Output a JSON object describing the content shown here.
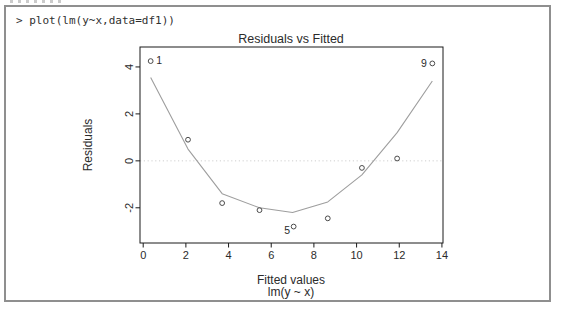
{
  "window": {
    "console": {
      "command": "> plot(lm(y~x,data=df1))"
    }
  },
  "chart_data": {
    "type": "scatter",
    "title": "Residuals vs Fitted",
    "xlabel": "Fitted values",
    "xlabel_sub": "lm(y ~ x)",
    "ylabel": "Residuals",
    "xlim": [
      -0.15,
      14.05
    ],
    "ylim": [
      -3.5,
      4.85
    ],
    "x_ticks": [
      0,
      2,
      4,
      6,
      8,
      10,
      12,
      14
    ],
    "y_ticks": [
      -2,
      0,
      2,
      4
    ],
    "grid": "off",
    "legend": "none",
    "zero_line": {
      "y": 0,
      "style": "dotted"
    },
    "points": [
      {
        "x": 0.35,
        "y": 4.25,
        "label": "1",
        "label_side": "right"
      },
      {
        "x": 2.1,
        "y": 0.9
      },
      {
        "x": 3.7,
        "y": -1.8
      },
      {
        "x": 5.45,
        "y": -2.1
      },
      {
        "x": 7.05,
        "y": -2.8,
        "label": "5",
        "label_side": "left-below"
      },
      {
        "x": 8.65,
        "y": -2.45
      },
      {
        "x": 10.25,
        "y": -0.3
      },
      {
        "x": 11.9,
        "y": 0.1
      },
      {
        "x": 13.55,
        "y": 4.15,
        "label": "9",
        "label_side": "left"
      }
    ],
    "smooth_line": {
      "name": "lowess-smooth",
      "x": [
        0.35,
        2.1,
        3.7,
        5.45,
        7.0,
        8.65,
        10.25,
        11.9,
        13.55
      ],
      "y": [
        3.55,
        0.5,
        -1.4,
        -2.0,
        -2.2,
        -1.75,
        -0.6,
        1.2,
        3.4
      ]
    },
    "colors": {
      "smooth_line": "#9e9e9e",
      "points": "#4a4a4a",
      "box": "#1a1a1a",
      "zero_line": "#cfcfcf",
      "text": "#2b2b2b",
      "frame_border": "#8f8f8f"
    }
  }
}
